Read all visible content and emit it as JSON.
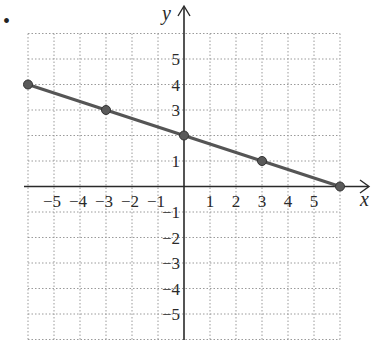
{
  "bullet": "•",
  "chart_data": {
    "type": "line",
    "title": "",
    "xlabel": "x",
    "ylabel": "y",
    "xlim": [
      -6,
      6
    ],
    "ylim": [
      -6,
      6
    ],
    "grid": true,
    "grid_style": "dotted",
    "x_tick_labels": [
      "−5",
      "−4",
      "−3",
      "−2",
      "−1",
      "1",
      "2",
      "3",
      "4",
      "5"
    ],
    "x_ticks": [
      -5,
      -4,
      -3,
      -2,
      -1,
      1,
      2,
      3,
      4,
      5
    ],
    "y_tick_labels": [
      "5",
      "4",
      "3",
      "1",
      "−1",
      "−2",
      "−3",
      "−4",
      "−5"
    ],
    "y_ticks": [
      5,
      4,
      3,
      1,
      -1,
      -2,
      -3,
      -4,
      -5
    ],
    "series": [
      {
        "name": "line",
        "points": [
          [
            -6,
            4
          ],
          [
            -3,
            3
          ],
          [
            0,
            2
          ],
          [
            3,
            1
          ],
          [
            6,
            0
          ]
        ],
        "x": [
          -6,
          -3,
          0,
          3,
          6
        ],
        "y": [
          4,
          3,
          2,
          1,
          0
        ],
        "color": "#555555",
        "markers": true
      }
    ],
    "legend": null
  },
  "colors": {
    "line": "#555555",
    "axis": "#2a2a2a",
    "grid": "#9a9a9a"
  }
}
